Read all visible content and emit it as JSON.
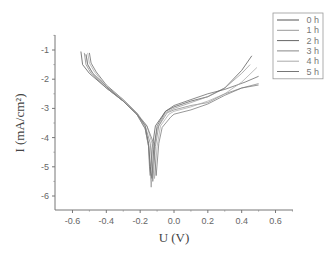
{
  "chart_data": {
    "type": "line",
    "title": "",
    "xlabel": "U (V)",
    "ylabel": "I (mA/cm²)",
    "xlim": [
      -0.7,
      0.7
    ],
    "ylim": [
      -6.5,
      -0.5
    ],
    "xticks": [
      "-0.6",
      "-0.4",
      "-0.2",
      "0.0",
      "0.2",
      "0.4",
      "0.6"
    ],
    "yticks": [
      "-1",
      "-2",
      "-3",
      "-4",
      "-5",
      "-6"
    ],
    "grid": false,
    "legend_position": "top-right",
    "series": [
      {
        "name": "0 h",
        "color": "#555555",
        "x": [
          -0.55,
          -0.54,
          -0.5,
          -0.4,
          -0.3,
          -0.22,
          -0.17,
          -0.15,
          -0.145,
          -0.14,
          -0.13,
          -0.11,
          -0.05,
          0.0,
          0.1,
          0.2,
          0.3,
          0.4,
          0.46
        ],
        "y": [
          -1.05,
          -1.5,
          -1.8,
          -2.3,
          -2.75,
          -3.2,
          -3.7,
          -4.3,
          -5.0,
          -5.3,
          -4.4,
          -3.6,
          -3.1,
          -2.95,
          -2.75,
          -2.6,
          -2.3,
          -1.7,
          -1.2
        ]
      },
      {
        "name": "1 h",
        "color": "#999999",
        "x": [
          -0.52,
          -0.51,
          -0.48,
          -0.4,
          -0.3,
          -0.22,
          -0.17,
          -0.15,
          -0.14,
          -0.135,
          -0.12,
          -0.1,
          -0.05,
          0.0,
          0.1,
          0.2,
          0.3,
          0.4,
          0.45
        ],
        "y": [
          -1.15,
          -1.5,
          -1.8,
          -2.25,
          -2.75,
          -3.2,
          -3.7,
          -4.3,
          -5.2,
          -5.7,
          -4.5,
          -3.7,
          -3.15,
          -3.0,
          -2.8,
          -2.6,
          -2.3,
          -1.8,
          -1.5
        ]
      },
      {
        "name": "2 h",
        "color": "#666666",
        "x": [
          -0.5,
          -0.49,
          -0.46,
          -0.4,
          -0.3,
          -0.22,
          -0.17,
          -0.15,
          -0.14,
          -0.13,
          -0.12,
          -0.1,
          -0.05,
          0.0,
          0.1,
          0.2,
          0.3,
          0.42,
          0.5
        ],
        "y": [
          -1.1,
          -1.45,
          -1.75,
          -2.2,
          -2.7,
          -3.15,
          -3.6,
          -4.2,
          -5.0,
          -5.4,
          -4.4,
          -3.6,
          -3.1,
          -2.9,
          -2.7,
          -2.5,
          -2.35,
          -2.1,
          -1.9
        ]
      },
      {
        "name": "3 h",
        "color": "#888888",
        "x": [
          -0.53,
          -0.52,
          -0.49,
          -0.4,
          -0.3,
          -0.22,
          -0.17,
          -0.14,
          -0.13,
          -0.125,
          -0.11,
          -0.09,
          -0.04,
          0.0,
          0.1,
          0.2,
          0.3,
          0.4,
          0.5
        ],
        "y": [
          -1.1,
          -1.5,
          -1.8,
          -2.3,
          -2.75,
          -3.2,
          -3.6,
          -4.2,
          -5.1,
          -5.5,
          -4.3,
          -3.6,
          -3.15,
          -3.05,
          -2.9,
          -2.8,
          -2.5,
          -2.3,
          -2.15
        ]
      },
      {
        "name": "4 h",
        "color": "#aaaaaa",
        "x": [
          -0.51,
          -0.5,
          -0.47,
          -0.4,
          -0.3,
          -0.22,
          -0.16,
          -0.13,
          -0.12,
          -0.115,
          -0.1,
          -0.08,
          -0.03,
          0.0,
          0.1,
          0.2,
          0.3,
          0.4,
          0.49
        ],
        "y": [
          -1.1,
          -1.45,
          -1.75,
          -2.25,
          -2.7,
          -3.15,
          -3.6,
          -4.2,
          -5.0,
          -5.4,
          -4.3,
          -3.6,
          -3.2,
          -3.1,
          -2.95,
          -2.75,
          -2.5,
          -2.1,
          -1.6
        ]
      },
      {
        "name": "5 h",
        "color": "#777777",
        "x": [
          -0.52,
          -0.51,
          -0.48,
          -0.4,
          -0.3,
          -0.22,
          -0.16,
          -0.12,
          -0.11,
          -0.105,
          -0.09,
          -0.07,
          -0.02,
          0.0,
          0.1,
          0.2,
          0.3,
          0.4,
          0.5
        ],
        "y": [
          -1.15,
          -1.5,
          -1.8,
          -2.25,
          -2.75,
          -3.2,
          -3.6,
          -4.2,
          -4.9,
          -5.3,
          -4.2,
          -3.65,
          -3.3,
          -3.2,
          -3.05,
          -2.85,
          -2.55,
          -2.3,
          -2.2
        ]
      }
    ]
  }
}
